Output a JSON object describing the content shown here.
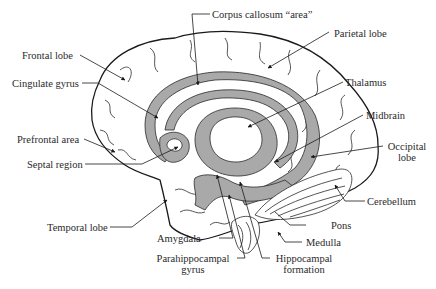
{
  "diagram": {
    "labels": {
      "corpus_callosum": "Corpus callosum “area”",
      "frontal_lobe": "Frontal lobe",
      "parietal_lobe": "Parietal lobe",
      "cingulate_gyrus": "Cingulate gyrus",
      "thalamus": "Thalamus",
      "midbrain": "Midbrain",
      "prefrontal_area": "Prefrontal area",
      "occipital_lobe_line1": "Occipital",
      "occipital_lobe_line2": "lobe",
      "septal_region": "Septal region",
      "cerebellum": "Cerebellum",
      "temporal_lobe": "Temporal lobe",
      "pons": "Pons",
      "amygdala": "Amygdala",
      "medulla": "Medulla",
      "parahippocampal_line1": "Parahippocampal",
      "parahippocampal_line2": "gyrus",
      "hippocampal_line1": "Hippocampal",
      "hippocampal_line2": "formation"
    },
    "colors": {
      "shaded_structures": "#a9a9a9",
      "outline": "#1a1a1a",
      "background": "#ffffff"
    }
  }
}
